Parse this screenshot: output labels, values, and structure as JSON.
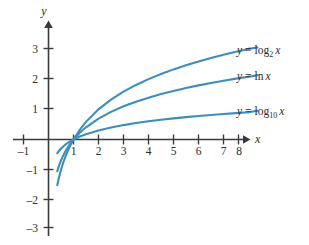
{
  "chart_data": {
    "type": "line",
    "title": "",
    "xlabel": "x",
    "ylabel": "y",
    "xlim": [
      -1.4,
      8.6
    ],
    "ylim": [
      -3.1,
      3.4
    ],
    "xticks": [
      -1,
      1,
      2,
      3,
      4,
      5,
      6,
      7,
      8
    ],
    "yticks": [
      3,
      2,
      1,
      -1,
      -2,
      -3
    ],
    "xtick_labels": [
      "–1",
      "1",
      "2",
      "3",
      "4",
      "5",
      "6",
      "7",
      "8"
    ],
    "ytick_labels": [
      "3",
      "2",
      "1",
      "–1",
      "–2",
      "–3"
    ],
    "grid": false,
    "legend_position": "right-inline",
    "accent_color": "#3d8dbe",
    "axis_color": "#3a3a3a",
    "background": "#ffffff",
    "series": [
      {
        "name": "y = log2 x",
        "label_prefix": "y",
        "label_equals": "=",
        "label_func": "log",
        "label_base": "2",
        "label_arg": "x",
        "x": [
          0.35,
          0.4,
          0.5,
          0.6,
          0.7,
          0.8,
          0.9,
          1,
          1.25,
          1.5,
          2,
          2.5,
          3,
          3.5,
          4,
          4.5,
          5,
          5.5,
          6,
          6.5,
          7,
          7.5,
          8
        ],
        "values": [
          -1.515,
          -1.322,
          -1,
          -0.737,
          -0.515,
          -0.322,
          -0.152,
          0,
          0.322,
          0.585,
          1,
          1.322,
          1.585,
          1.807,
          2,
          2.17,
          2.322,
          2.459,
          2.585,
          2.7,
          2.807,
          2.907,
          3
        ]
      },
      {
        "name": "y = ln x",
        "label_prefix": "y",
        "label_equals": "=",
        "label_func": "ln",
        "label_base": "",
        "label_arg": "x",
        "x": [
          0.35,
          0.4,
          0.5,
          0.6,
          0.7,
          0.8,
          0.9,
          1,
          1.25,
          1.5,
          2,
          2.5,
          3,
          3.5,
          4,
          4.5,
          5,
          5.5,
          6,
          6.5,
          7,
          7.5,
          8
        ],
        "values": [
          -1.05,
          -0.916,
          -0.693,
          -0.511,
          -0.357,
          -0.223,
          -0.105,
          0,
          0.223,
          0.405,
          0.693,
          0.916,
          1.099,
          1.253,
          1.386,
          1.504,
          1.609,
          1.705,
          1.792,
          1.872,
          1.946,
          2.015,
          2.079
        ]
      },
      {
        "name": "y = log10 x",
        "label_prefix": "y",
        "label_equals": "=",
        "label_func": "log",
        "label_base": "10",
        "label_arg": "x",
        "x": [
          0.35,
          0.4,
          0.5,
          0.6,
          0.7,
          0.8,
          0.9,
          1,
          1.25,
          1.5,
          2,
          2.5,
          3,
          3.5,
          4,
          4.5,
          5,
          5.5,
          6,
          6.5,
          7,
          7.5,
          8
        ],
        "values": [
          -0.456,
          -0.398,
          -0.301,
          -0.222,
          -0.155,
          -0.097,
          -0.046,
          0,
          0.097,
          0.176,
          0.301,
          0.398,
          0.477,
          0.544,
          0.602,
          0.653,
          0.699,
          0.74,
          0.778,
          0.813,
          0.845,
          0.875,
          0.903
        ]
      }
    ],
    "annotations": [
      {
        "text": "common point",
        "x": 1,
        "y": 0
      }
    ]
  }
}
